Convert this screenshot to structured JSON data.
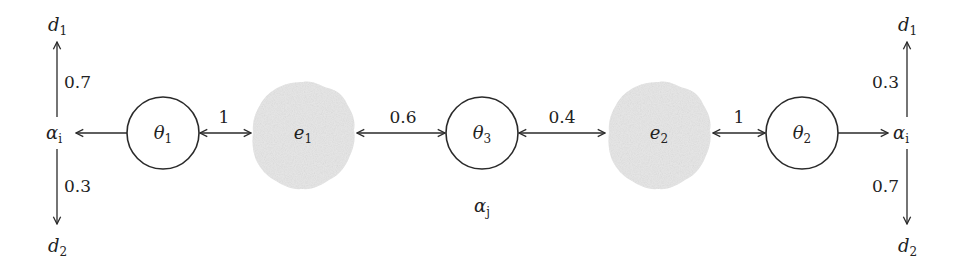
{
  "diagram": {
    "type": "flow-network",
    "colors": {
      "stroke": "#2a2a2a",
      "cloud_fill": "#e6e6e6",
      "background": "#ffffff"
    },
    "nodes": {
      "theta1": {
        "base": "θ",
        "sub": "1",
        "shape": "circle"
      },
      "theta3": {
        "base": "θ",
        "sub": "3",
        "shape": "circle"
      },
      "theta2": {
        "base": "θ",
        "sub": "2",
        "shape": "circle"
      },
      "e1": {
        "base": "e",
        "sub": "1",
        "shape": "cloud"
      },
      "e2": {
        "base": "e",
        "sub": "2",
        "shape": "cloud"
      },
      "alpha_left": {
        "base": "α",
        "sub": "i"
      },
      "alpha_right": {
        "base": "α",
        "sub": "i"
      },
      "alpha_j": {
        "base": "α",
        "sub": "j"
      },
      "d1_left": {
        "base": "d",
        "sub": "1"
      },
      "d2_left": {
        "base": "d",
        "sub": "2"
      },
      "d1_right": {
        "base": "d",
        "sub": "1"
      },
      "d2_right": {
        "base": "d",
        "sub": "2"
      }
    },
    "edges": {
      "alpha_left_to_d1": {
        "weight": "0.7"
      },
      "alpha_left_to_d2": {
        "weight": "0.3"
      },
      "theta1_e1": {
        "weight": "1"
      },
      "e1_theta3": {
        "weight": "0.6"
      },
      "theta3_e2": {
        "weight": "0.4"
      },
      "e2_theta2": {
        "weight": "1"
      },
      "alpha_right_to_d1": {
        "weight": "0.3"
      },
      "alpha_right_to_d2": {
        "weight": "0.7"
      }
    }
  }
}
